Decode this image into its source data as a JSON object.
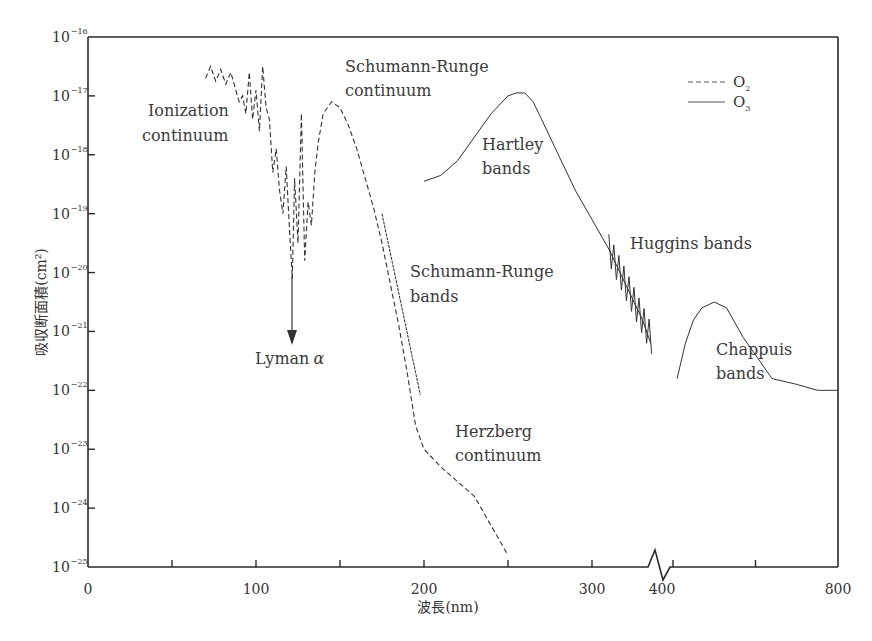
{
  "chart_data": {
    "type": "line",
    "title": "",
    "xlabel": "波長(nm)",
    "ylabel": "吸収断面積(cm²)",
    "yscale": "log",
    "ylim": [
      1e-25,
      1e-16
    ],
    "xlim": [
      0,
      800
    ],
    "x_axis_break": {
      "between": [
        300,
        400
      ],
      "note": "axis break zigzag between 300 and 400 nm; scale compressed beyond break"
    },
    "x_tick_labels": [
      "0",
      "100",
      "200",
      "300",
      "400",
      "800"
    ],
    "x_ticks": [
      0,
      50,
      100,
      150,
      200,
      250,
      300,
      400,
      600,
      800
    ],
    "y_tick_labels": [
      {
        "base": "10",
        "exp": "−16"
      },
      {
        "base": "10",
        "exp": "−17"
      },
      {
        "base": "10",
        "exp": "−18"
      },
      {
        "base": "10",
        "exp": "−19"
      },
      {
        "base": "10",
        "exp": "−20"
      },
      {
        "base": "10",
        "exp": "−21"
      },
      {
        "base": "10",
        "exp": "−22"
      },
      {
        "base": "10",
        "exp": "−23"
      },
      {
        "base": "10",
        "exp": "−24"
      },
      {
        "base": "10",
        "exp": "−25"
      }
    ],
    "grid": false,
    "legend": {
      "position": "top-right",
      "entries": [
        {
          "label": "O",
          "sub": "2",
          "style": "dashed"
        },
        {
          "label": "O",
          "sub": "3",
          "style": "solid"
        }
      ]
    },
    "series": [
      {
        "name": "O2",
        "style": "dashed",
        "points_log10": [
          [
            70,
            -16.7
          ],
          [
            73,
            -16.5
          ],
          [
            76,
            -16.75
          ],
          [
            79,
            -16.55
          ],
          [
            82,
            -16.8
          ],
          [
            85,
            -16.6
          ],
          [
            88,
            -16.9
          ],
          [
            90,
            -17.1
          ],
          [
            92,
            -17.0
          ],
          [
            94,
            -17.3
          ],
          [
            96,
            -16.6
          ],
          [
            98,
            -17.4
          ],
          [
            100,
            -16.9
          ],
          [
            102,
            -17.6
          ],
          [
            104,
            -16.5
          ],
          [
            106,
            -17.2
          ],
          [
            108,
            -17.4
          ],
          [
            110,
            -18.3
          ],
          [
            112,
            -17.9
          ],
          [
            114,
            -18.6
          ],
          [
            116,
            -19.0
          ],
          [
            118,
            -18.2
          ],
          [
            120,
            -19.3
          ],
          [
            121.6,
            -20.1
          ],
          [
            123,
            -18.4
          ],
          [
            125,
            -19.5
          ],
          [
            127,
            -17.3
          ],
          [
            129,
            -19.8
          ],
          [
            131,
            -18.8
          ],
          [
            133,
            -19.2
          ],
          [
            135,
            -18.3
          ],
          [
            137,
            -17.8
          ],
          [
            140,
            -17.3
          ],
          [
            145,
            -17.1
          ],
          [
            150,
            -17.2
          ],
          [
            155,
            -17.5
          ],
          [
            160,
            -17.9
          ],
          [
            165,
            -18.4
          ],
          [
            170,
            -18.9
          ],
          [
            175,
            -19.5
          ],
          [
            180,
            -20.2
          ],
          [
            185,
            -20.9
          ],
          [
            190,
            -21.7
          ],
          [
            195,
            -22.6
          ],
          [
            200,
            -23.0
          ],
          [
            210,
            -23.3
          ],
          [
            220,
            -23.55
          ],
          [
            230,
            -23.8
          ],
          [
            240,
            -24.3
          ],
          [
            250,
            -24.8
          ]
        ]
      },
      {
        "name": "O3",
        "style": "solid",
        "points_log10": [
          [
            200,
            -18.45
          ],
          [
            210,
            -18.35
          ],
          [
            220,
            -18.1
          ],
          [
            230,
            -17.7
          ],
          [
            240,
            -17.3
          ],
          [
            250,
            -17.0
          ],
          [
            255,
            -16.95
          ],
          [
            260,
            -16.95
          ],
          [
            265,
            -17.1
          ],
          [
            270,
            -17.4
          ],
          [
            280,
            -18.0
          ],
          [
            290,
            -18.6
          ],
          [
            300,
            -19.1
          ],
          [
            310,
            -19.6
          ],
          [
            320,
            -20.2
          ],
          [
            330,
            -20.8
          ],
          [
            335,
            -21.2
          ],
          [
            410,
            -21.8
          ],
          [
            430,
            -21.2
          ],
          [
            450,
            -20.8
          ],
          [
            470,
            -20.6
          ],
          [
            500,
            -20.5
          ],
          [
            530,
            -20.6
          ],
          [
            570,
            -21.1
          ],
          [
            600,
            -21.4
          ],
          [
            640,
            -21.8
          ],
          [
            700,
            -21.9
          ],
          [
            750,
            -22.0
          ],
          [
            800,
            -22.0
          ]
        ]
      }
    ],
    "annotations": [
      {
        "text": [
          "Ionization",
          "continuum"
        ],
        "near": "O2 50–100 nm"
      },
      {
        "text": [
          "Schumann-Runge",
          "continuum"
        ],
        "near": "O2 140–175 nm"
      },
      {
        "text": [
          "Schumann-Runge",
          "bands"
        ],
        "near": "O2 175–200 nm"
      },
      {
        "text": [
          "Herzberg",
          "continuum"
        ],
        "near": "O2 200–250 nm"
      },
      {
        "text": [
          "Lyman α"
        ],
        "near": "121.6 nm",
        "arrow": true
      },
      {
        "text": [
          "Hartley",
          "bands"
        ],
        "near": "O3 200–300 nm"
      },
      {
        "text": [
          "Huggins bands"
        ],
        "near": "O3 300–340 nm"
      },
      {
        "text": [
          "Chappuis",
          "bands"
        ],
        "near": "O3 400–800 nm"
      }
    ]
  },
  "labels": {
    "ylabel": "吸収断面積(cm²)",
    "xlabel": "波長(nm)",
    "lyman": "Lyman",
    "lyman_greek": "α",
    "ionization_1": "Ionization",
    "ionization_2": "continuum",
    "sr_cont_1": "Schumann-Runge",
    "sr_cont_2": "continuum",
    "sr_bands_1": "Schumann-Runge",
    "sr_bands_2": "bands",
    "herzberg_1": "Herzberg",
    "herzberg_2": "continuum",
    "hartley_1": "Hartley",
    "hartley_2": "bands",
    "huggins": "Huggins bands",
    "chappuis_1": "Chappuis",
    "chappuis_2": "bands",
    "legend_o2": "O",
    "legend_o2_sub": "2",
    "legend_o3": "O",
    "legend_o3_sub": "3"
  },
  "colors": {
    "axis": "#2a2a2a",
    "curve": "#333333",
    "text": "#333333",
    "background": "#ffffff"
  }
}
